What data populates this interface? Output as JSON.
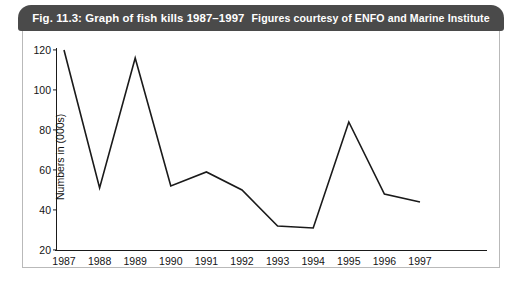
{
  "figure": {
    "caption_label": "Fig. 11.3: Graph of fish kills 1987–1997",
    "credit_label": "Figures courtesy of ENFO and Marine Institute"
  },
  "chart_data": {
    "type": "line",
    "title": "Fig. 11.3: Graph of fish kills 1987–1997",
    "subtitle": "Figures courtesy of ENFO and Marine Institute",
    "xlabel": "",
    "ylabel": "Numbers in (000s)",
    "categories": [
      "1987",
      "1988",
      "1989",
      "1990",
      "1991",
      "1992",
      "1993",
      "1994",
      "1995",
      "1996",
      "1997"
    ],
    "values": [
      120,
      51,
      116,
      52,
      59,
      50,
      32,
      31,
      84,
      48,
      44
    ],
    "series": [
      {
        "name": "Fish kills",
        "values": [
          120,
          51,
          116,
          52,
          59,
          50,
          32,
          31,
          84,
          48,
          44
        ]
      }
    ],
    "ylim": [
      20,
      120
    ],
    "yticks": [
      20,
      40,
      60,
      80,
      100,
      120
    ],
    "ytick_labels": [
      "20",
      "40",
      "60",
      "80",
      "100",
      "120"
    ],
    "grid": false,
    "legend": false,
    "line_color": "#1a1a1a",
    "markers": false
  },
  "colors": {
    "caption_bar": "#4a4a4a",
    "caption_text": "#ffffff",
    "axis": "#1a1a1a",
    "frame": "#b9b9b9",
    "background": "#ffffff"
  }
}
